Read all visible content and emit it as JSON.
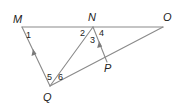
{
  "diagram": {
    "type": "geometry",
    "points": {
      "M": {
        "label": "M",
        "x": 22,
        "y": 27
      },
      "N": {
        "label": "N",
        "x": 93,
        "y": 27
      },
      "O": {
        "label": "O",
        "x": 163,
        "y": 27
      },
      "Q": {
        "label": "Q",
        "x": 50,
        "y": 86
      },
      "P": {
        "label": "P",
        "x": 107,
        "y": 62
      }
    },
    "segments": [
      {
        "from": "M",
        "to": "O"
      },
      {
        "from": "M",
        "to": "Q"
      },
      {
        "from": "N",
        "to": "Q"
      },
      {
        "from": "Q",
        "to": "O"
      },
      {
        "from": "P",
        "to": "N"
      }
    ],
    "parallel_marks": [
      {
        "segment": "QM",
        "direction": "toward M"
      },
      {
        "segment": "PN",
        "direction": "toward N"
      }
    ],
    "angles": [
      {
        "label": "1",
        "vertex": "M"
      },
      {
        "label": "2",
        "vertex": "N"
      },
      {
        "label": "3",
        "vertex": "N"
      },
      {
        "label": "4",
        "vertex": "N"
      },
      {
        "label": "5",
        "vertex": "Q"
      },
      {
        "label": "6",
        "vertex": "Q"
      }
    ],
    "colors": {
      "line": "#8a8a8a",
      "text": "#222222"
    }
  }
}
